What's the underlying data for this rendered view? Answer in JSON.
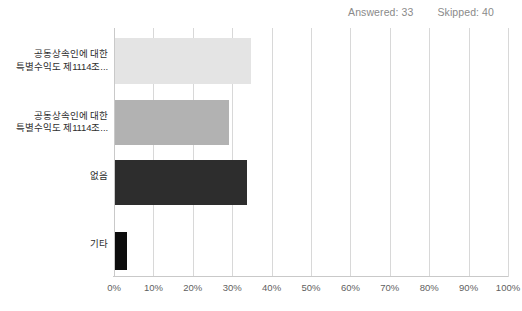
{
  "header": {
    "answered_label": "Answered: 33",
    "skipped_label": "Skipped: 40"
  },
  "colors": {
    "bar_1": "#e4e4e4",
    "bar_2": "#b2b2b2",
    "bar_3": "#2d2d2d",
    "bar_4": "#0d0d0d",
    "gridline": "#d8d8d8",
    "axis": "#c9c9c9",
    "label_text": "#2e2e2e",
    "tick_text": "#5f5f5f",
    "header_text": "#8a8a8a"
  },
  "chart_data": {
    "type": "bar",
    "orientation": "horizontal",
    "title": "",
    "xlabel": "",
    "ylabel": "",
    "xlim": [
      0,
      100
    ],
    "grid": "vertical",
    "legend": "none",
    "categories": [
      "공동상속인에 대한 특별수익도 제1114조...",
      "공동상속인에 대한 특별수익도 제1114조...",
      "없음",
      "기타"
    ],
    "values": [
      34.5,
      29.0,
      33.5,
      3.0
    ],
    "value_suffix": "%",
    "tick_labels": [
      "0%",
      "10%",
      "20%",
      "30%",
      "40%",
      "50%",
      "60%",
      "70%",
      "80%",
      "90%",
      "100%"
    ],
    "tick_values": [
      0,
      10,
      20,
      30,
      40,
      50,
      60,
      70,
      80,
      90,
      100
    ],
    "answered": 33,
    "skipped": 40
  }
}
